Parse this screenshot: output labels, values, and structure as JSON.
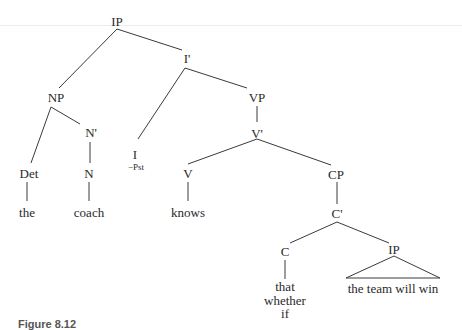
{
  "figure": {
    "caption": "Figure 8.12",
    "type": "syntax tree"
  },
  "tree": {
    "root": {
      "label": "IP"
    },
    "i_bar": {
      "label": "I'"
    },
    "np": {
      "label": "NP"
    },
    "n_bar": {
      "label": "N'"
    },
    "det": {
      "label": "Det"
    },
    "n": {
      "label": "N"
    },
    "det_word": {
      "label": "the"
    },
    "n_word": {
      "label": "coach"
    },
    "infl": {
      "label": "I",
      "feature": "−Pst"
    },
    "vp": {
      "label": "VP"
    },
    "v_bar": {
      "label": "V'"
    },
    "v": {
      "label": "V"
    },
    "v_word": {
      "label": "knows"
    },
    "cp": {
      "label": "CP"
    },
    "c_bar": {
      "label": "C'"
    },
    "c": {
      "label": "C"
    },
    "c_words": [
      "that",
      "whether",
      "if"
    ],
    "embedded_ip": {
      "label": "IP",
      "terminal": "the team will win"
    }
  }
}
